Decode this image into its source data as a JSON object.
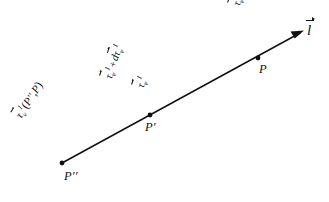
{
  "figure": {
    "background_color": "#ffffff",
    "ink_color": "#111111",
    "line": {
      "name": "l",
      "label": "l",
      "has_arrowhead_at_end": true,
      "start": [
        62,
        163
      ],
      "end": [
        303,
        32
      ]
    },
    "points": [
      {
        "id": "P-double-prime",
        "label": "P′′",
        "x": 62,
        "y": 163
      },
      {
        "id": "P-prime",
        "label": "P′",
        "x": 150,
        "y": 115
      },
      {
        "id": "P",
        "label": "P",
        "x": 258,
        "y": 58
      }
    ],
    "labels": {
      "tau_at_P": {
        "tau": "τ",
        "sub": "v",
        "sup": "1",
        "operator": "=",
        "value": "0",
        "rotation_deg": -71
      },
      "tau_sum_at_P_prime": {
        "tau": "τ",
        "sub": "v",
        "sup": "1",
        "operator": "+",
        "differential": "d",
        "tau2": "τ",
        "sub2": "v",
        "sup2": "1",
        "rotation_deg": -71
      },
      "tau_at_P_prime": {
        "tau": "τ",
        "sub": "v",
        "sup": "1",
        "rotation_deg": -71
      },
      "tau_at_P_double_prime": {
        "tau": "τ",
        "sub": "v",
        "sup": "1",
        "open_paren": "(",
        "arg1": "P′′",
        "comma": ",",
        "arg2": "P",
        "close_paren": ")",
        "rotation_deg": -57
      }
    }
  }
}
